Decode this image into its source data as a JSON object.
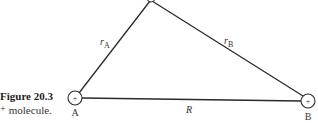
{
  "caption": {
    "title": "Figure 20.3",
    "text": "⁺ molecule."
  },
  "nodes": {
    "apex": {
      "label": ""
    },
    "A": {
      "label": "A",
      "charge": "+"
    },
    "B": {
      "label": "B",
      "charge": "+"
    }
  },
  "edges": {
    "rA": {
      "symbol": "r",
      "subscript": "A"
    },
    "rB": {
      "symbol": "r",
      "subscript": "B"
    },
    "R": {
      "label": "R"
    }
  },
  "colors": {
    "line": "#2a2a2a",
    "background": "#ffffff"
  }
}
